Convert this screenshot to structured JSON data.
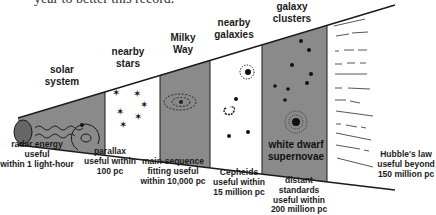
{
  "caption_fragment": "year to better this record.",
  "regions": [
    {
      "label": "solar\nsystem",
      "fill": "#8a8a8a"
    },
    {
      "label": "nearby\nstars",
      "fill": "#ffffff"
    },
    {
      "label": "Milky\nWay",
      "fill": "#8a8a8a"
    },
    {
      "label": "nearby\ngalaxies",
      "fill": "#ffffff"
    },
    {
      "label": "galaxy\nclusters",
      "fill": "#8a8a8a"
    }
  ],
  "inset_label": "white dwarf\nsupernovae",
  "methods": [
    {
      "label": "radar energy useful\nwithin 1 light-hour"
    },
    {
      "label": "parallax\nuseful within\n100 pc"
    },
    {
      "label": "main-sequence\nfitting useful\nwithin 10,000 pc"
    },
    {
      "label": "Cepheids\nuseful within\n15 million pc"
    },
    {
      "label": "distant\nstandards\nuseful within\n200 million pc"
    },
    {
      "label": "Hubble's law\nuseful beyond\n150 million pc"
    }
  ],
  "colors": {
    "gray_band": "#8a8a8a",
    "outline": "#1a1a1a",
    "white_band": "#ffffff"
  }
}
